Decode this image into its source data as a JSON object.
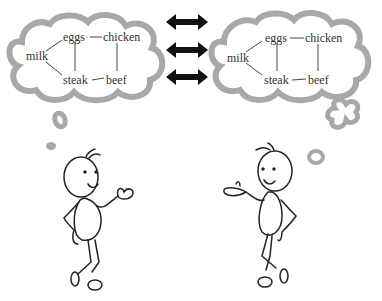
{
  "left_map": {
    "nodes": {
      "milk": "milk",
      "eggs": "eggs",
      "chicken": "chicken",
      "steak": "steak",
      "beef": "beef"
    }
  },
  "right_map": {
    "nodes": {
      "milk": "milk",
      "eggs": "eggs",
      "chicken": "chicken",
      "steak": "steak",
      "beef": "beef"
    }
  },
  "edges": [
    [
      "milk",
      "eggs"
    ],
    [
      "milk",
      "steak"
    ],
    [
      "eggs",
      "chicken"
    ],
    [
      "eggs",
      "steak"
    ],
    [
      "chicken",
      "beef"
    ],
    [
      "steak",
      "beef"
    ]
  ],
  "arrows": {
    "count": 3,
    "type": "double-headed"
  },
  "colors": {
    "cloud": "#a8a8a8",
    "line": "#222222",
    "text": "#333333"
  }
}
